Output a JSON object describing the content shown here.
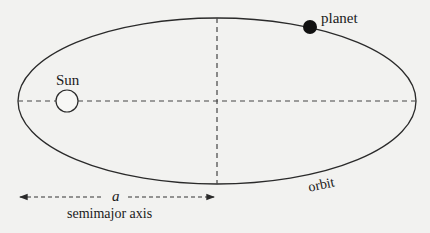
{
  "diagram": {
    "labels": {
      "sun": "Sun",
      "planet": "planet",
      "a": "a",
      "semimajor_axis": "semimajor axis",
      "orbit": "orbit"
    },
    "colors": {
      "background": "#f2f2f0",
      "line": "#2a2a2a",
      "planet_fill": "#111111"
    },
    "elements": {
      "ellipse": {
        "cx": 217,
        "cy": 101,
        "rx": 199,
        "ry": 83
      },
      "sun": {
        "cx": 67,
        "cy": 101,
        "r": 11
      },
      "planet": {
        "cx": 310,
        "cy": 27,
        "r": 7
      },
      "major_axis": {
        "style": "dashed"
      },
      "minor_axis": {
        "style": "dashed"
      },
      "semimajor_arrow": {
        "x1": 18,
        "x2": 216,
        "y": 197,
        "style": "dashed",
        "heads": "both"
      }
    }
  }
}
